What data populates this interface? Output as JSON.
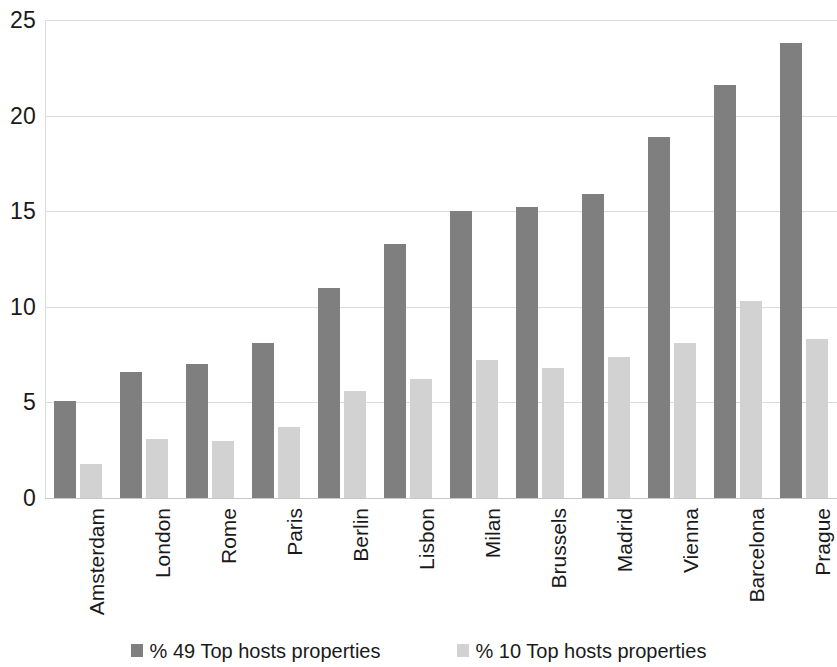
{
  "chart_data": {
    "type": "bar",
    "title": "",
    "subtitle": "",
    "xlabel": "",
    "ylabel": "",
    "ylim": [
      0,
      25
    ],
    "yticks": [
      0,
      5,
      10,
      15,
      20,
      25
    ],
    "ytick_labels": [
      "0",
      "5",
      "10",
      "15",
      "20",
      "25"
    ],
    "grid": true,
    "grid_axis": "y",
    "legend_position": "bottom",
    "categories": [
      "Amsterdam",
      "London",
      "Rome",
      "Paris",
      "Berlin",
      "Lisbon",
      "Milan",
      "Brussels",
      "Madrid",
      "Vienna",
      "Barcelona",
      "Prague"
    ],
    "series": [
      {
        "name": "% 49 Top hosts properties",
        "color": "#7f7f7f",
        "values": [
          5.1,
          6.6,
          7.0,
          8.1,
          11.0,
          13.3,
          15.0,
          15.2,
          15.9,
          18.9,
          21.6,
          23.8
        ]
      },
      {
        "name": "% 10 Top hosts properties",
        "color": "#d2d2d2",
        "values": [
          1.8,
          3.1,
          3.0,
          3.7,
          5.6,
          6.2,
          7.2,
          6.8,
          7.4,
          8.1,
          10.3,
          8.3
        ]
      }
    ]
  },
  "legend": {
    "items": [
      {
        "label": "% 49 Top hosts properties",
        "color": "#7f7f7f"
      },
      {
        "label": "% 10 Top hosts properties",
        "color": "#d2d2d2"
      }
    ]
  },
  "colors": {
    "series_a": "#7f7f7f",
    "series_b": "#d2d2d2",
    "gridline": "#dcdcdc",
    "text": "#1a1a1a",
    "background": "#ffffff"
  }
}
